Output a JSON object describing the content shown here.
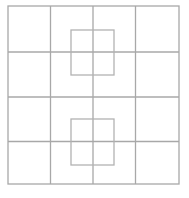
{
  "figure": {
    "type": "square-grid-puzzle",
    "canvas": {
      "width": 189,
      "height": 198,
      "background": "#ffffff"
    },
    "line_color": "#a8a8a8",
    "inner_square_color": "#b2b2b2",
    "line_width": 1.3,
    "outer_square": {
      "x": 8,
      "y": 6,
      "width": 171,
      "height": 178
    },
    "grid": {
      "rows": 4,
      "cols": 4,
      "interior_vertical_x": [
        50.5,
        93,
        135.5
      ],
      "interior_horizontal_y": [
        52,
        97,
        141.5
      ]
    },
    "inner_squares": [
      {
        "x": 71,
        "y": 30,
        "width": 43,
        "height": 45
      },
      {
        "x": 71,
        "y": 119,
        "width": 43,
        "height": 46
      }
    ]
  }
}
